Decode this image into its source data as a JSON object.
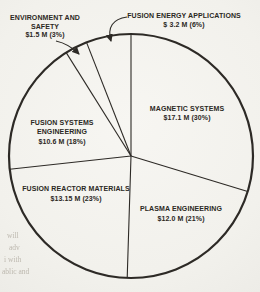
{
  "figure": {
    "kind": "scanned-report-pie-chart",
    "ink_color": "#2d2a26",
    "paper_color": "#f4f3ef"
  },
  "chart_data": {
    "type": "pie",
    "style": "outline-only",
    "unit": "M USD",
    "start_angle_deg": 0,
    "direction": "clockwise",
    "total_value_m": 57.55,
    "geometry": {
      "cx": 131,
      "cy": 156,
      "r": 122
    },
    "slices": [
      {
        "name": "Magnetic Systems",
        "value_m": 17.1,
        "percent": 30,
        "label_lines": [
          "MAGNETIC SYSTEMS",
          "$17.1 M (30%)"
        ]
      },
      {
        "name": "Plasma Engineering",
        "value_m": 12.0,
        "percent": 21,
        "label_lines": [
          "PLASMA ENGINEERING",
          "$12.0 M (21%)"
        ]
      },
      {
        "name": "Fusion Reactor Materials",
        "value_m": 13.15,
        "percent": 23,
        "label_lines": [
          "FUSION REACTOR MATERIALS",
          "$13.15 M (23%)"
        ]
      },
      {
        "name": "Fusion Systems Engineering",
        "value_m": 10.6,
        "percent": 18,
        "label_lines": [
          "FUSION SYSTEMS",
          "ENGINEERING",
          "$10.6 M (18%)"
        ]
      },
      {
        "name": "Environment and Safety",
        "value_m": 1.5,
        "percent": 3,
        "label_lines": [
          "ENVIRONMENT AND",
          "SAFETY",
          "$1.5 M (3%)"
        ]
      },
      {
        "name": "Fusion Energy Applications",
        "value_m": 3.2,
        "percent": 6,
        "label_lines": [
          "FUSION ENERGY APPLICATIONS",
          "$ 3.2 M (6%)"
        ]
      }
    ]
  },
  "ghost_text": [
    "will",
    "adv",
    "i with",
    "ablic and"
  ]
}
